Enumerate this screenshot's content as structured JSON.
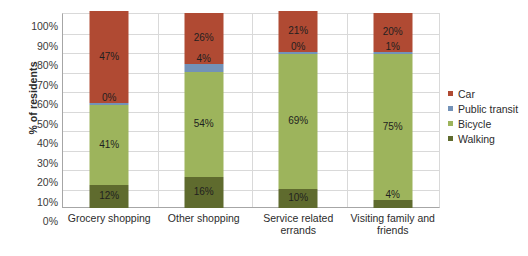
{
  "chart_data": {
    "type": "bar",
    "subtype": "stacked-bar-100",
    "title": "",
    "xlabel": "",
    "ylabel": "% of residents",
    "ylim": [
      0,
      100
    ],
    "ytick_labels": [
      "0%",
      "10%",
      "20%",
      "30%",
      "40%",
      "50%",
      "60%",
      "70%",
      "80%",
      "90%",
      "100%"
    ],
    "ytick_values": [
      0,
      10,
      20,
      30,
      40,
      50,
      60,
      70,
      80,
      90,
      100
    ],
    "grid": true,
    "legend_position": "right",
    "categories": [
      "Grocery shopping",
      "Other shopping",
      "Service related errands",
      "Visiting family and friends"
    ],
    "series": [
      {
        "name": "Walking",
        "color": "#5F6B2E",
        "values": [
          12,
          16,
          10,
          4
        ],
        "labels": [
          "12%",
          "16%",
          "10%",
          "4%"
        ]
      },
      {
        "name": "Bicycle",
        "color": "#9DB45C",
        "values": [
          41,
          54,
          69,
          75
        ],
        "labels": [
          "41%",
          "54%",
          "69%",
          "75%"
        ]
      },
      {
        "name": "Public transit",
        "color": "#7392B8",
        "values": [
          0,
          4,
          0,
          1
        ],
        "labels": [
          "0%",
          "4%",
          "0%",
          "1%"
        ]
      },
      {
        "name": "Car",
        "color": "#B04A33",
        "values": [
          47,
          26,
          21,
          20
        ],
        "labels": [
          "47%",
          "26%",
          "21%",
          "20%"
        ]
      }
    ],
    "legend_entries": [
      {
        "label": "Car",
        "color": "#B04A33"
      },
      {
        "label": "Public transit",
        "color": "#7392B8"
      },
      {
        "label": "Bicycle",
        "color": "#9DB45C"
      },
      {
        "label": "Walking",
        "color": "#5F6B2E"
      }
    ]
  },
  "colors": {
    "car": "#B04A33",
    "public_transit": "#7392B8",
    "bicycle": "#9DB45C",
    "walking": "#5F6B2E",
    "gridline": "#D9D9D9",
    "axis": "#A6A6A6",
    "text": "#2B2B2B",
    "background": "#FFFFFF"
  }
}
